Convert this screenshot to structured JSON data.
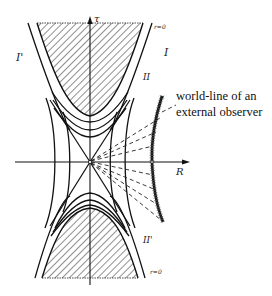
{
  "diagram": {
    "type": "Penrose-like spacetime diagram (Kruskal-type)",
    "axes": {
      "vertical_label": "τ",
      "horizontal_label": "R"
    },
    "regions": {
      "right_exterior": "I",
      "left_exterior": "I'",
      "upper_label": "II",
      "lower_label": "II'"
    },
    "singularity_labels": {
      "top": "r=0",
      "bottom": "r=0"
    },
    "annotation": {
      "line1": "world-line of an",
      "line2": "external observer"
    },
    "colors": {
      "ink": "#1a1a1a",
      "background": "#ffffff"
    }
  }
}
